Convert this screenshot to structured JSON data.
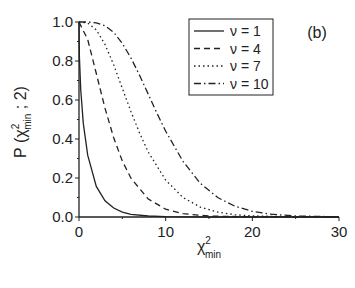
{
  "panel_label": "(b)",
  "chart_data": {
    "type": "line",
    "title": "",
    "xlabel": "χ²min",
    "ylabel": "P(χ²min; 2)",
    "xlim": [
      0,
      30
    ],
    "ylim": [
      0,
      1.0
    ],
    "xticks": [
      0,
      10,
      20,
      30
    ],
    "yticks": [
      0.0,
      0.2,
      0.4,
      0.6,
      0.8,
      1.0
    ],
    "ytick_labels": [
      "0.0",
      "0.2",
      "0.4",
      "0.6",
      "0.8",
      "1.0"
    ],
    "grid": false,
    "legend_position": "upper right",
    "series": [
      {
        "name": "ν = 1",
        "style": "solid",
        "x": [
          0,
          0.05,
          0.2,
          0.5,
          1,
          2,
          3,
          4,
          5,
          6,
          8,
          10,
          15,
          30
        ],
        "y": [
          1,
          0.823,
          0.655,
          0.48,
          0.317,
          0.157,
          0.083,
          0.046,
          0.025,
          0.014,
          0.005,
          0.0016,
          0.0001,
          0
        ]
      },
      {
        "name": "ν = 4",
        "style": "dash",
        "x": [
          0,
          1,
          2,
          3,
          4,
          5,
          6,
          8,
          10,
          12,
          15,
          20,
          30
        ],
        "y": [
          1,
          0.91,
          0.736,
          0.558,
          0.406,
          0.287,
          0.199,
          0.092,
          0.04,
          0.017,
          0.005,
          0.0005,
          0
        ]
      },
      {
        "name": "ν = 7",
        "style": "dot",
        "x": [
          0,
          1,
          2,
          3,
          4,
          5,
          6,
          7,
          8,
          10,
          12,
          14,
          16,
          18,
          20,
          25,
          30
        ],
        "y": [
          1,
          0.995,
          0.96,
          0.885,
          0.78,
          0.66,
          0.54,
          0.429,
          0.333,
          0.189,
          0.1,
          0.051,
          0.025,
          0.012,
          0.0056,
          0.0008,
          0.0001
        ]
      },
      {
        "name": "ν = 10",
        "style": "dashdot",
        "x": [
          0,
          1,
          2,
          3,
          4,
          5,
          6,
          7,
          8,
          9,
          10,
          12,
          14,
          16,
          18,
          20,
          22,
          25,
          30
        ],
        "y": [
          1,
          0.9998,
          0.996,
          0.981,
          0.947,
          0.891,
          0.815,
          0.725,
          0.629,
          0.532,
          0.44,
          0.285,
          0.173,
          0.1,
          0.055,
          0.029,
          0.015,
          0.005,
          0.0009
        ]
      }
    ]
  }
}
